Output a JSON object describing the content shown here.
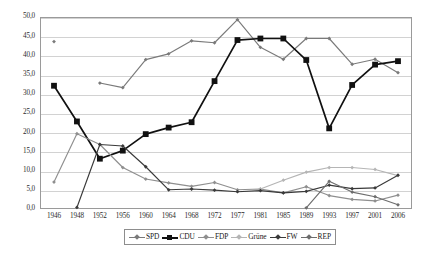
{
  "chart_data": {
    "type": "line",
    "title": "",
    "subtitle": "",
    "xlabel": "",
    "ylabel": "",
    "ylim": [
      0.0,
      50.0
    ],
    "yticks": [
      "0,0",
      "5,0",
      "10,0",
      "15,0",
      "20,0",
      "25,0",
      "30,0",
      "35,0",
      "40,0",
      "45,0",
      "50,0"
    ],
    "ytick_values": [
      0,
      5,
      10,
      15,
      20,
      25,
      30,
      35,
      40,
      45,
      50
    ],
    "grid": true,
    "legend_position": "bottom",
    "categories": [
      "1946",
      "1948",
      "1952",
      "1956",
      "1960",
      "1964",
      "1968",
      "1972",
      "1977",
      "1981",
      "1985",
      "1989",
      "1993",
      "1997",
      "2001",
      "2006"
    ],
    "series": [
      {
        "name": "SPD",
        "color": "#7a7a7a",
        "marker": "diamond",
        "values": [
          43.6,
          null,
          32.8,
          31.6,
          38.9,
          40.4,
          43.8,
          43.3,
          49.3,
          42.1,
          39.0,
          44.4,
          44.4,
          37.7,
          39.0,
          35.5
        ]
      },
      {
        "name": "CDU",
        "color": "#111111",
        "marker": "square",
        "values": [
          32.1,
          22.8,
          13.1,
          15.2,
          19.5,
          21.2,
          22.6,
          33.3,
          44.0,
          44.4,
          44.4,
          38.8,
          21.0,
          32.3,
          37.6,
          38.5
        ]
      },
      {
        "name": "FDP",
        "color": "#8f8f8f",
        "marker": "diamond",
        "values": [
          7.0,
          19.6,
          16.8,
          10.8,
          7.8,
          6.8,
          5.9,
          6.9,
          5.0,
          5.2,
          4.2,
          5.8,
          3.5,
          2.5,
          2.1,
          3.6
        ]
      },
      {
        "name": "Grüne",
        "color": "#b5b5b5",
        "marker": "diamond",
        "values": [
          null,
          null,
          null,
          null,
          null,
          null,
          null,
          null,
          null,
          5.2,
          7.5,
          9.6,
          10.8,
          10.8,
          10.3,
          8.7
        ]
      },
      {
        "name": "FW",
        "color": "#3a3a3a",
        "marker": "diamond",
        "values": [
          null,
          0.4,
          16.8,
          16.4,
          11.0,
          5.0,
          5.2,
          4.9,
          4.5,
          4.8,
          4.2,
          4.6,
          6.2,
          5.3,
          5.5,
          8.8
        ]
      },
      {
        "name": "REP",
        "color": "#6d6d6d",
        "marker": "diamond",
        "values": [
          null,
          null,
          null,
          null,
          null,
          null,
          null,
          null,
          null,
          null,
          null,
          0.3,
          7.2,
          4.4,
          3.2,
          1.1
        ]
      }
    ]
  },
  "legend": {
    "items": [
      {
        "label": "SPD",
        "color": "#7a7a7a",
        "marker": "diamond"
      },
      {
        "label": "CDU",
        "color": "#111111",
        "marker": "square"
      },
      {
        "label": "FDP",
        "color": "#8f8f8f",
        "marker": "diamond"
      },
      {
        "label": "Grüne",
        "color": "#b5b5b5",
        "marker": "diamond"
      },
      {
        "label": "FW",
        "color": "#3a3a3a",
        "marker": "diamond"
      },
      {
        "label": "REP",
        "color": "#6d6d6d",
        "marker": "diamond"
      }
    ]
  },
  "colors": {
    "frame": "#9a9a9a",
    "grid": "#d2d2d2",
    "background": "#ffffff",
    "text": "#1a1a1a"
  }
}
